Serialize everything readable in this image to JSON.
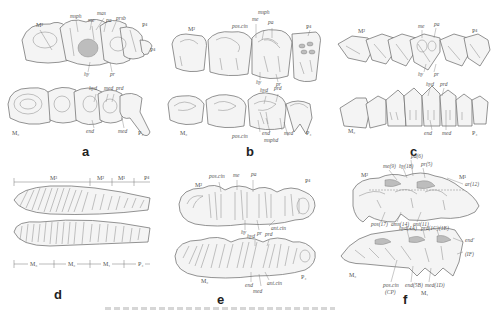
{
  "figure": {
    "panels": [
      {
        "letter": "a",
        "upper_tooth_labels": [
          "M²",
          "P⁴",
          "P⁴"
        ],
        "lower_tooth_labels": [
          "M₂",
          "P₄"
        ],
        "cusp_labels_upper": [
          "msph",
          "mas",
          "me",
          "pa",
          "prsb",
          "hy",
          "pr"
        ],
        "cusp_labels_lower": [
          "hyd",
          "med",
          "prd",
          "end",
          "med"
        ]
      },
      {
        "letter": "b",
        "upper_tooth_labels": [
          "M²",
          "P⁴"
        ],
        "lower_tooth_labels": [
          "M₂",
          "P₄"
        ],
        "cusp_labels_upper": [
          "msph",
          "me",
          "pos.cin",
          "pa",
          "hy",
          "pr"
        ],
        "cusp_labels_lower": [
          "hyd",
          "prd",
          "pos.cin",
          "end",
          "msphd",
          "med"
        ]
      },
      {
        "letter": "c",
        "upper_tooth_labels": [
          "M²",
          "P⁴"
        ],
        "lower_tooth_labels": [
          "M₂",
          "P₄"
        ],
        "cusp_labels_upper": [
          "me",
          "pa",
          "hy",
          "pr"
        ],
        "cusp_labels_lower": [
          "hyd",
          "prd",
          "end",
          "med"
        ]
      },
      {
        "letter": "d",
        "upper_scale_labels": [
          "M³",
          "M²",
          "M¹",
          "P⁴"
        ],
        "lower_scale_labels": [
          "M₃",
          "M₂",
          "M₁",
          "P₄"
        ]
      },
      {
        "letter": "e",
        "upper_tooth_labels": [
          "M²",
          "P⁴"
        ],
        "lower_tooth_labels": [
          "M₂",
          "P₄"
        ],
        "cusp_labels_upper": [
          "pos.cin",
          "me",
          "pa",
          "hy",
          "pr",
          "ant.cin"
        ],
        "cusp_labels_lower": [
          "hyd",
          "prd",
          "end",
          "med",
          "ant.cin"
        ]
      },
      {
        "letter": "f",
        "upper_tooth_labels": [
          "M²",
          "M¹"
        ],
        "lower_tooth_labels": [
          "M₂",
          "M₁"
        ],
        "cusp_labels_upper": [
          "pa(6)",
          "me(9)",
          "hy(18)",
          "pr(5)",
          "ar(12)",
          "pos(17)",
          "ams(14)",
          "ant(11)"
        ],
        "cusp_labels_lower": [
          "hyd(4A)",
          "prd(1C)",
          "(1E)",
          "end'",
          "(IF)",
          "pos.cin",
          "(CP)",
          "end(5B)",
          "med(1D)"
        ]
      }
    ]
  }
}
